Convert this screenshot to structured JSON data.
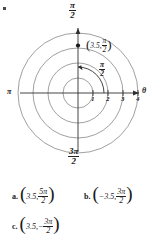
{
  "figure": {
    "type": "polar-coordinate-grid",
    "axis_labels": {
      "top": {
        "num": "π",
        "den": "2"
      },
      "bottom": {
        "num": "3π",
        "den": "2"
      },
      "left": "π",
      "right": "θ"
    },
    "radial_ticks": [
      "1",
      "2",
      "3",
      "4"
    ],
    "circles": [
      1,
      2,
      3,
      4
    ],
    "point": {
      "r": "3.5",
      "theta_num": "π",
      "theta_den": "2",
      "label_r": "3.5,",
      "open_paren": "(",
      "close_paren": ")"
    },
    "arc": {
      "num": "π",
      "den": "2"
    }
  },
  "answers": [
    {
      "letter": "a.",
      "open_paren": "(",
      "r": "3.5,",
      "sign": "",
      "num": "5π",
      "den": "2",
      "close_paren": ")"
    },
    {
      "letter": "b.",
      "open_paren": "(",
      "r": "−3.5,",
      "sign": "",
      "num": "3π",
      "den": "2",
      "close_paren": ")"
    },
    {
      "letter": "c.",
      "open_paren": "(",
      "r": "3.5,",
      "sign": "−",
      "num": "3π",
      "den": "2",
      "close_paren": ")"
    }
  ],
  "colors": {
    "ink": "#1a1a1a",
    "grid": "#6e6e6e",
    "axis": "#3a3a3a",
    "background": "#ffffff"
  }
}
